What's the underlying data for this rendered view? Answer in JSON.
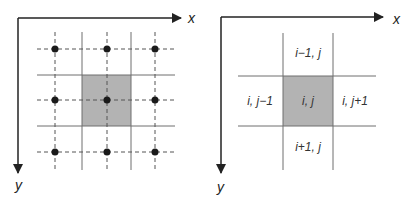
{
  "colors": {
    "axis": "#222222",
    "grid_line": "#6e6e6e",
    "dashed_line": "#555555",
    "shade": "#b3b3b3",
    "node": "#1a1a1a",
    "text": "#333333"
  },
  "left_panel": {
    "x_axis_label": "x",
    "y_axis_label": "y",
    "description": "3x3 grid of nodes at dashed-line intersections with central cell shaded"
  },
  "right_panel": {
    "x_axis_label": "x",
    "y_axis_label": "y",
    "cells": {
      "top": "i−1, j",
      "left": "i, j−1",
      "center": "i, j",
      "right": "i, j+1",
      "bottom": "i+1, j"
    }
  }
}
